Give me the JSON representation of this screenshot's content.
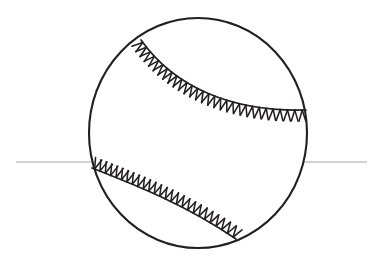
{
  "canvas": {
    "width": 380,
    "height": 273,
    "background": "#ffffff",
    "title": "Baseball line drawing"
  },
  "colors": {
    "ink": "#231f20",
    "ball_fill": "#ffffff",
    "baseline": "#a7a7a7"
  },
  "ball": {
    "label": "baseball",
    "center": {
      "x": 198,
      "y": 133
    },
    "radius_x": 109,
    "radius_y": 115,
    "outline_width": 2.1
  },
  "baseline": {
    "label": "horizontal-rule",
    "y": 162,
    "x_start": 16,
    "x_end": 367,
    "width": 1
  },
  "seams": [
    {
      "name": "upper-seam",
      "start": {
        "x": 141,
        "y": 40
      },
      "control1": {
        "x": 175,
        "y": 88
      },
      "control2": {
        "x": 233,
        "y": 112
      },
      "end": {
        "x": 306,
        "y": 110
      },
      "stitch_count": 29,
      "stitch_length": 11.5,
      "stitch_spread": 34,
      "stitch_side": 1,
      "stroke_width": 1.7
    },
    {
      "name": "lower-seam",
      "start": {
        "x": 92,
        "y": 168
      },
      "control1": {
        "x": 138,
        "y": 186
      },
      "control2": {
        "x": 186,
        "y": 205
      },
      "end": {
        "x": 236,
        "y": 239
      },
      "stitch_count": 26,
      "stitch_length": 11.5,
      "stitch_spread": 34,
      "stitch_side": -1,
      "stroke_width": 1.7
    }
  ]
}
